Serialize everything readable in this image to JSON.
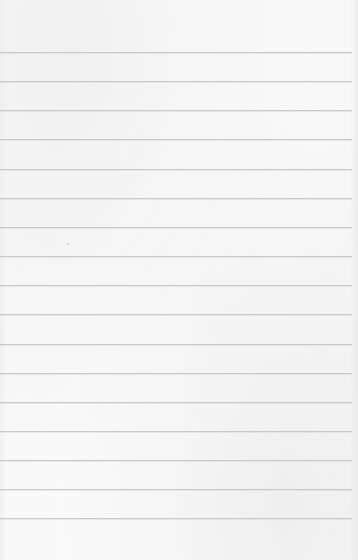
{
  "paper": {
    "type": "lined-paper",
    "background_color": "#fafafa",
    "line_color": "#c9c9c9",
    "line_count": 17,
    "first_line_y": 52,
    "line_spacing": 29.15,
    "line_right_edge": 352
  }
}
